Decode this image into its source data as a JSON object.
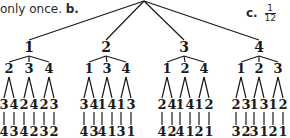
{
  "captions": {
    "left_text": "only once.",
    "left_label": "b.",
    "right_label": "c.",
    "right_fraction": {
      "numerator": "1",
      "denominator": "12"
    }
  },
  "tree": {
    "root": {
      "x": 144,
      "y": 1
    },
    "branches": [
      {
        "label": "1",
        "x": 29,
        "children": [
          {
            "label": "2",
            "x": 9,
            "leaves": [
              {
                "mid": "3",
                "end": "4"
              },
              {
                "mid": "4",
                "end": "3"
              }
            ]
          },
          {
            "label": "3",
            "x": 29,
            "leaves": [
              {
                "mid": "2",
                "end": "4"
              },
              {
                "mid": "4",
                "end": "2"
              }
            ]
          },
          {
            "label": "4",
            "x": 49,
            "leaves": [
              {
                "mid": "2",
                "end": "3"
              },
              {
                "mid": "3",
                "end": "2"
              }
            ]
          }
        ]
      },
      {
        "label": "2",
        "x": 106,
        "children": [
          {
            "label": "1",
            "x": 89,
            "leaves": [
              {
                "mid": "3",
                "end": "4"
              },
              {
                "mid": "4",
                "end": "3"
              }
            ]
          },
          {
            "label": "3",
            "x": 107,
            "leaves": [
              {
                "mid": "1",
                "end": "4"
              },
              {
                "mid": "4",
                "end": "1"
              }
            ]
          },
          {
            "label": "4",
            "x": 126,
            "leaves": [
              {
                "mid": "1",
                "end": "3"
              },
              {
                "mid": "3",
                "end": "1"
              }
            ]
          }
        ]
      },
      {
        "label": "3",
        "x": 184,
        "children": [
          {
            "label": "1",
            "x": 167,
            "leaves": [
              {
                "mid": "2",
                "end": "4"
              },
              {
                "mid": "4",
                "end": "2"
              }
            ]
          },
          {
            "label": "2",
            "x": 185,
            "leaves": [
              {
                "mid": "1",
                "end": "4"
              },
              {
                "mid": "4",
                "end": "1"
              }
            ]
          },
          {
            "label": "4",
            "x": 204,
            "leaves": [
              {
                "mid": "1",
                "end": "2"
              },
              {
                "mid": "2",
                "end": "1"
              }
            ]
          }
        ]
      },
      {
        "label": "4",
        "x": 259,
        "children": [
          {
            "label": "1",
            "x": 241,
            "leaves": [
              {
                "mid": "2",
                "end": "3"
              },
              {
                "mid": "3",
                "end": "2"
              }
            ]
          },
          {
            "label": "2",
            "x": 259,
            "leaves": [
              {
                "mid": "1",
                "end": "3"
              },
              {
                "mid": "3",
                "end": "1"
              }
            ]
          },
          {
            "label": "3",
            "x": 278,
            "leaves": [
              {
                "mid": "1",
                "end": "2"
              },
              {
                "mid": "2",
                "end": "1"
              }
            ]
          }
        ]
      }
    ]
  }
}
